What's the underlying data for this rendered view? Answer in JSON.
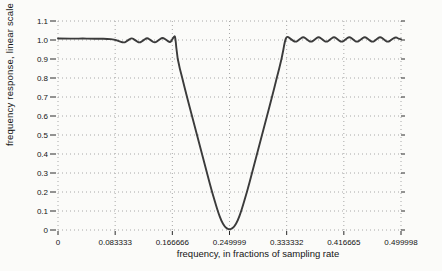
{
  "page": {
    "background": "#fbfbf9"
  },
  "chart_data": {
    "type": "line",
    "title": "",
    "xlabel": "frequency, in fractions of sampling rate",
    "ylabel": "frequency response, linear scale",
    "xlim": [
      0,
      0.499998
    ],
    "ylim": [
      0,
      1.1
    ],
    "grid": "dotted",
    "legend": "none",
    "colors": {
      "line": "#3b3b3b",
      "grid": "#a8a8a8",
      "tick": "#2a2a2a",
      "text": "#141414",
      "background": "#fbfbf9"
    },
    "x_ticks": [
      {
        "value": 0.0,
        "label": "0"
      },
      {
        "value": 0.083333,
        "label": "0.083333"
      },
      {
        "value": 0.166666,
        "label": "0.166666"
      },
      {
        "value": 0.249999,
        "label": "0.249999"
      },
      {
        "value": 0.333332,
        "label": "0.333332"
      },
      {
        "value": 0.416665,
        "label": "0.416665"
      },
      {
        "value": 0.499998,
        "label": "0.499998"
      }
    ],
    "y_ticks": [
      {
        "value": 0.0,
        "label": "0"
      },
      {
        "value": 0.1,
        "label": "0.1"
      },
      {
        "value": 0.2,
        "label": "0.2"
      },
      {
        "value": 0.3,
        "label": "0.3"
      },
      {
        "value": 0.4,
        "label": "0.4"
      },
      {
        "value": 0.5,
        "label": "0.5"
      },
      {
        "value": 0.6,
        "label": "0.6"
      },
      {
        "value": 0.7,
        "label": "0.7"
      },
      {
        "value": 0.8,
        "label": "0.8"
      },
      {
        "value": 0.9,
        "label": "0.9"
      },
      {
        "value": 1.0,
        "label": "1.0"
      },
      {
        "value": 1.1,
        "label": "1.1"
      }
    ],
    "series": [
      {
        "name": "band-reject frequency response",
        "points": [
          [
            0.0,
            1.008
          ],
          [
            0.012,
            1.008
          ],
          [
            0.024,
            1.007
          ],
          [
            0.036,
            1.008
          ],
          [
            0.048,
            1.007
          ],
          [
            0.06,
            1.007
          ],
          [
            0.072,
            1.006
          ],
          [
            0.082,
            1.003
          ],
          [
            0.0875,
            0.996
          ],
          [
            0.0962,
            0.984
          ],
          [
            0.1018,
            0.998
          ],
          [
            0.1074,
            1.012
          ],
          [
            0.113,
            0.998
          ],
          [
            0.1187,
            0.984
          ],
          [
            0.1243,
            0.998
          ],
          [
            0.1299,
            1.013
          ],
          [
            0.1355,
            0.998
          ],
          [
            0.1412,
            0.984
          ],
          [
            0.1468,
            0.999
          ],
          [
            0.1524,
            1.014
          ],
          [
            0.158,
            0.999
          ],
          [
            0.1637,
            0.986
          ],
          [
            0.1665,
            1.002
          ],
          [
            0.169,
            1.018
          ],
          [
            0.171,
            1.021
          ],
          [
            0.1739,
            0.9
          ],
          [
            0.1812,
            0.8
          ],
          [
            0.188,
            0.7
          ],
          [
            0.1953,
            0.6
          ],
          [
            0.2026,
            0.5
          ],
          [
            0.2099,
            0.4
          ],
          [
            0.2172,
            0.3
          ],
          [
            0.2245,
            0.2
          ],
          [
            0.2328,
            0.1
          ],
          [
            0.238,
            0.048
          ],
          [
            0.243,
            0.018
          ],
          [
            0.247,
            0.006
          ],
          [
            0.25,
            0.003
          ],
          [
            0.253,
            0.006
          ],
          [
            0.257,
            0.018
          ],
          [
            0.262,
            0.048
          ],
          [
            0.2672,
            0.1
          ],
          [
            0.2755,
            0.2
          ],
          [
            0.2828,
            0.3
          ],
          [
            0.2901,
            0.4
          ],
          [
            0.2974,
            0.5
          ],
          [
            0.3047,
            0.6
          ],
          [
            0.312,
            0.7
          ],
          [
            0.3188,
            0.8
          ],
          [
            0.3261,
            0.9
          ],
          [
            0.3309,
            1.0
          ],
          [
            0.334,
            1.021
          ],
          [
            0.34,
            1.003
          ],
          [
            0.3462,
            0.988
          ],
          [
            0.3518,
            1.003
          ],
          [
            0.3574,
            1.018
          ],
          [
            0.363,
            1.003
          ],
          [
            0.3687,
            0.988
          ],
          [
            0.3743,
            1.003
          ],
          [
            0.3799,
            1.018
          ],
          [
            0.3855,
            1.003
          ],
          [
            0.3911,
            0.988
          ],
          [
            0.3967,
            1.003
          ],
          [
            0.4023,
            1.018
          ],
          [
            0.4079,
            1.003
          ],
          [
            0.4135,
            0.988
          ],
          [
            0.4191,
            1.003
          ],
          [
            0.4247,
            1.018
          ],
          [
            0.4303,
            1.003
          ],
          [
            0.4359,
            0.988
          ],
          [
            0.4415,
            1.003
          ],
          [
            0.4472,
            1.018
          ],
          [
            0.4528,
            1.003
          ],
          [
            0.4584,
            0.988
          ],
          [
            0.464,
            1.003
          ],
          [
            0.4696,
            1.018
          ],
          [
            0.4752,
            1.003
          ],
          [
            0.4808,
            0.988
          ],
          [
            0.4864,
            1.003
          ],
          [
            0.492,
            1.016
          ],
          [
            0.496,
            1.008
          ],
          [
            0.49998,
            1.004
          ]
        ]
      }
    ]
  }
}
